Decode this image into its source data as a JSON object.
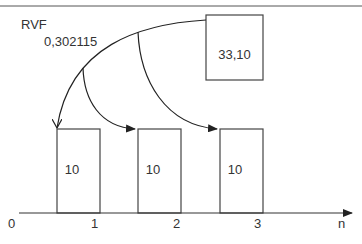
{
  "diagram": {
    "title_label": "RVF",
    "rate_label": "0,302115",
    "source_box": {
      "label": "33,10"
    },
    "bars": [
      {
        "label": "10"
      },
      {
        "label": "10"
      },
      {
        "label": "10"
      }
    ],
    "axis": {
      "origin_label": "0",
      "ticks": [
        "1",
        "2",
        "3"
      ],
      "axis_label": "n"
    },
    "colors": {
      "stroke": "#333333",
      "background": "#ffffff"
    }
  }
}
